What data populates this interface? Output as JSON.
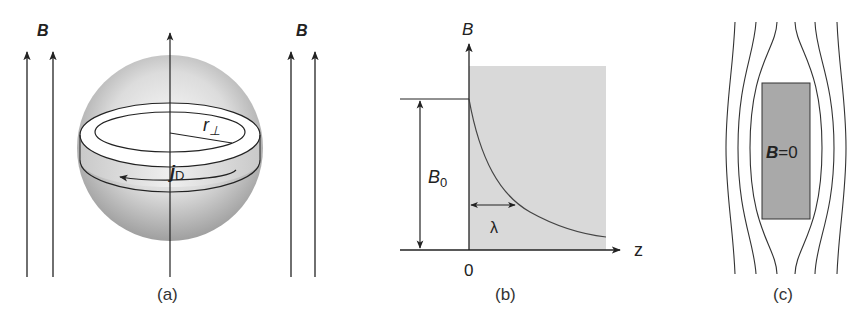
{
  "figure": {
    "panels": [
      {
        "id": "a",
        "caption": "(a)",
        "field_label_left": "B",
        "field_label_right": "B",
        "radius_label": "r",
        "radius_subscript": "⊥",
        "current_label": "j",
        "current_subscript": "D"
      },
      {
        "id": "b",
        "caption": "(b)",
        "y_axis_label": "B",
        "x_axis_label": "z",
        "origin_label": "0",
        "amplitude_label": "B",
        "amplitude_subscript": "0",
        "decay_length_label": "λ"
      },
      {
        "id": "c",
        "caption": "(c)",
        "interior_label_symbol": "B",
        "interior_label_value": "=0"
      }
    ]
  },
  "colors": {
    "line": "#222222",
    "shade": "#d8d8d8",
    "shade_dark": "#a8a8a8"
  }
}
